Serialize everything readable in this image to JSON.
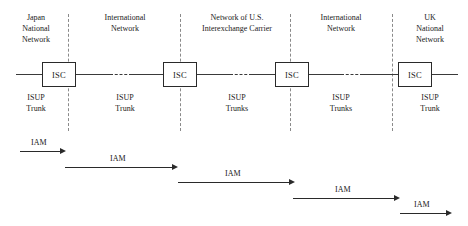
{
  "diagram": {
    "segments": [
      {
        "name": "Japan National Network",
        "label": "Japan\nNational\nNetwork",
        "trunk": "ISUP\nTrunk"
      },
      {
        "name": "International Network (Japan side)",
        "label": "International\nNetwork",
        "trunk": "ISUP\nTrunk"
      },
      {
        "name": "Network of U.S. Interexchange Carrier",
        "label": "Network of U.S.\nInterexchange Carrier",
        "trunk": "ISUP\nTrunks"
      },
      {
        "name": "International Network (UK side)",
        "label": "International\nNetwork",
        "trunk": "ISUP\nTrunks"
      },
      {
        "name": "UK National Network",
        "label": "UK\nNational\nNetwork",
        "trunk": "ISUP\nTrunk"
      }
    ],
    "switches": [
      {
        "label": "ISC"
      },
      {
        "label": "ISC"
      },
      {
        "label": "ISC"
      },
      {
        "label": "ISC"
      }
    ],
    "messages": [
      {
        "label": "IAM"
      },
      {
        "label": "IAM"
      },
      {
        "label": "IAM"
      },
      {
        "label": "IAM"
      },
      {
        "label": "IAM"
      }
    ],
    "colors": {
      "line": "#3a3a3a",
      "divider": "#8a8a8a",
      "text": "#1a1a1a",
      "background": "#ffffff"
    }
  }
}
